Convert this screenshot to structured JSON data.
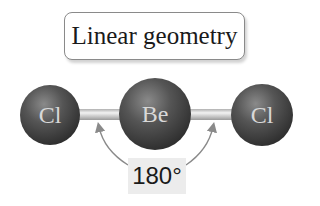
{
  "diagram": {
    "title": "Linear geometry",
    "molecule": "BeCl2",
    "atoms": [
      {
        "symbol": "Cl",
        "position": "left"
      },
      {
        "symbol": "Be",
        "position": "center"
      },
      {
        "symbol": "Cl",
        "position": "right"
      }
    ],
    "bond_angle": "180°",
    "colors": {
      "atom_fill": "#4a4a4a",
      "atom_label": "#d8d8d8",
      "bond": "#c8c8c8",
      "arrow": "#8a8a8a",
      "angle_box_bg": "#ececec"
    }
  }
}
